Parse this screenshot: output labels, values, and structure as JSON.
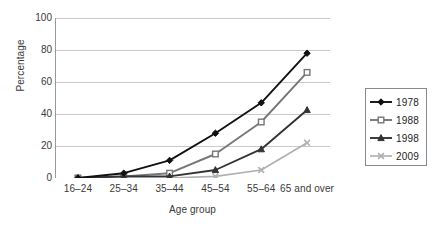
{
  "chart_data": {
    "type": "line",
    "title": "",
    "xlabel": "Age group",
    "ylabel": "Percentage",
    "categories": [
      "16–24",
      "25–34",
      "35–44",
      "45–54",
      "55–64",
      "65 and over"
    ],
    "ylim": [
      0,
      100
    ],
    "yticks": [
      0,
      20,
      40,
      60,
      80,
      100
    ],
    "ytick_labels": [
      "0",
      "20",
      "40",
      "60",
      "80",
      "100"
    ],
    "grid": "horizontal",
    "legend_position": "right",
    "series": [
      {
        "name": "1978",
        "marker": "diamond",
        "color": "#111111",
        "values": [
          0,
          3,
          11,
          28,
          47,
          78
        ]
      },
      {
        "name": "1988",
        "marker": "square",
        "color": "#777777",
        "values": [
          0,
          1,
          3,
          15,
          35,
          66
        ]
      },
      {
        "name": "1998",
        "marker": "triangle",
        "color": "#333333",
        "values": [
          0,
          1,
          1,
          5,
          18,
          42.5
        ]
      },
      {
        "name": "2009",
        "marker": "x",
        "color": "#b0b0b0",
        "values": [
          0,
          0,
          0,
          1,
          5,
          22
        ]
      }
    ]
  },
  "axes": {
    "y_title": "Percentage",
    "x_title": "Age group"
  },
  "legend": {
    "entries": [
      {
        "label": "1978"
      },
      {
        "label": "1988"
      },
      {
        "label": "1998"
      },
      {
        "label": "2009"
      }
    ]
  },
  "style": {
    "grid_color": "#c9c9c9",
    "axis_color": "#9a9a9a",
    "text_color": "#3a3a3a",
    "background": "#ffffff"
  }
}
